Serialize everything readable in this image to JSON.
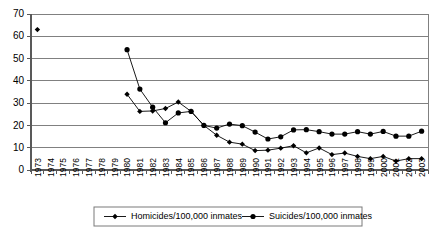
{
  "chart_data": {
    "type": "line",
    "title": "",
    "subtitle": "",
    "xlabel": "",
    "ylabel": "",
    "ylim": [
      0,
      70
    ],
    "ytick_step": 10,
    "yticks": [
      0,
      10,
      20,
      30,
      40,
      50,
      60,
      70
    ],
    "ytick_labels": [
      "0",
      "10",
      "20",
      "30",
      "40",
      "50",
      "60",
      "70"
    ],
    "grid": true,
    "legend_position": "bottom",
    "categories": [
      "1973",
      "1974",
      "1975",
      "1976",
      "1977",
      "1978",
      "1979",
      "1980",
      "1981",
      "1982",
      "1983",
      "1984",
      "1985",
      "1986",
      "1987",
      "1988",
      "1989",
      "1990",
      "1991",
      "1992",
      "1993",
      "1994",
      "1995",
      "1996",
      "1997",
      "1998",
      "1999",
      "2000",
      "2001",
      "2002",
      "2003"
    ],
    "series": [
      {
        "name": "Homicides/100,000 inmates",
        "marker": "diamond",
        "color": "#000000",
        "values": [
          63,
          null,
          null,
          null,
          null,
          null,
          null,
          34,
          26.3,
          26.5,
          27.6,
          30.5,
          26.3,
          20,
          15.6,
          12.5,
          11.6,
          8.7,
          8.9,
          9.8,
          10.9,
          7.7,
          9.9,
          6.9,
          7.6,
          6.1,
          5.1,
          6.1,
          4.0,
          5.1,
          5.1
        ]
      },
      {
        "name": "Suicides/100,000 inmates",
        "marker": "circle",
        "color": "#000000",
        "values": [
          null,
          null,
          null,
          null,
          null,
          null,
          null,
          54,
          36.3,
          28.2,
          21.2,
          25.6,
          26.3,
          20,
          18.8,
          20.6,
          19.9,
          17,
          13.9,
          14.9,
          18,
          18.1,
          17.2,
          16.1,
          16.1,
          17.2,
          16.1,
          17.3,
          15.2,
          15.2,
          17.4
        ]
      }
    ]
  },
  "legend": {
    "items": [
      {
        "label": "Homicides/100,000 inmates",
        "marker": "diamond"
      },
      {
        "label": "Suicides/100,000 inmates",
        "marker": "circle"
      }
    ]
  }
}
